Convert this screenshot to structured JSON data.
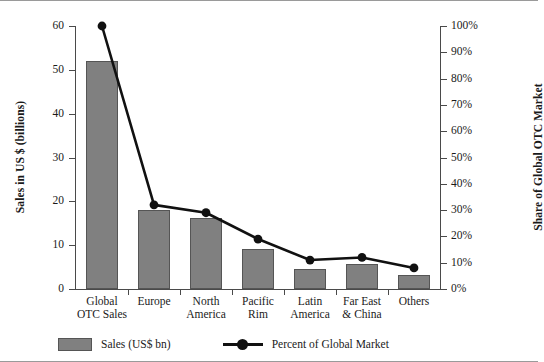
{
  "chart_data": {
    "type": "bar",
    "title": "",
    "subtitle": "",
    "xlabel": "",
    "ylabel": "Sales in US $ (billions)",
    "y2label": "Share of Global OTC Market",
    "grid": false,
    "legend_position": "bottom-left",
    "ylim": [
      0,
      60
    ],
    "y2lim": [
      0,
      100
    ],
    "categories": [
      "Global\nOTC Sales",
      "Europe",
      "North\nAmerica",
      "Pacific\nRim",
      "Latin\nAmerica",
      "Far East\n& China",
      "Others"
    ],
    "category_lines": [
      [
        "Global",
        "OTC Sales"
      ],
      [
        "Europe",
        ""
      ],
      [
        "North",
        "America"
      ],
      [
        "Pacific",
        "Rim"
      ],
      [
        "Latin",
        "America"
      ],
      [
        "Far East",
        "& China"
      ],
      [
        "Others",
        ""
      ]
    ],
    "yticks": [
      0,
      10,
      20,
      30,
      40,
      50,
      60
    ],
    "ytick_labels": [
      "0",
      "10",
      "20",
      "30",
      "40",
      "50",
      "60"
    ],
    "y2ticks": [
      0,
      10,
      20,
      30,
      40,
      50,
      60,
      70,
      80,
      90,
      100
    ],
    "y2tick_labels": [
      "0%",
      "10%",
      "20%",
      "30%",
      "40%",
      "50%",
      "60%",
      "70%",
      "80%",
      "90%",
      "100%"
    ],
    "series": [
      {
        "name": "Sales (US$ bn)",
        "type": "bar",
        "axis": "left",
        "unit": "US$ bn",
        "color": "#808080",
        "values": [
          52,
          18,
          16.2,
          9.2,
          4.6,
          5.6,
          3.2
        ]
      },
      {
        "name": "Percent of Global Market",
        "type": "line",
        "axis": "right",
        "unit": "%",
        "color": "#111111",
        "values": [
          100,
          32,
          29,
          19,
          11,
          12,
          8
        ]
      }
    ]
  },
  "legend": {
    "items": [
      {
        "label": "Sales (US$ bn)",
        "marker": "square-swatch",
        "color": "#808080"
      },
      {
        "label": "Percent of Global Market",
        "marker": "line-with-dot",
        "color": "#111111"
      }
    ]
  }
}
